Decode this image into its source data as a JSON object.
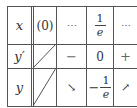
{
  "table": {
    "rows": [
      {
        "header": "x",
        "cells": [
          "(0)",
          "⋯",
          {
            "type": "fraction",
            "num": "1",
            "den": "e"
          },
          "⋯"
        ]
      },
      {
        "header": "y′",
        "cells": [
          "",
          "−",
          "0",
          "+"
        ]
      },
      {
        "header": "y",
        "cells": [
          "",
          "↘",
          {
            "type": "neg-fraction",
            "sign": "−",
            "num": "1",
            "den": "e"
          },
          "↗"
        ]
      }
    ]
  },
  "labels": {
    "x": "x",
    "yprime": "y′",
    "y": "y",
    "zero_paren": "(0)",
    "dots": "⋯",
    "one": "1",
    "e": "e",
    "minus": "−",
    "zero": "0",
    "plus": "+",
    "down_arrow": "↘",
    "up_arrow": "↗"
  }
}
